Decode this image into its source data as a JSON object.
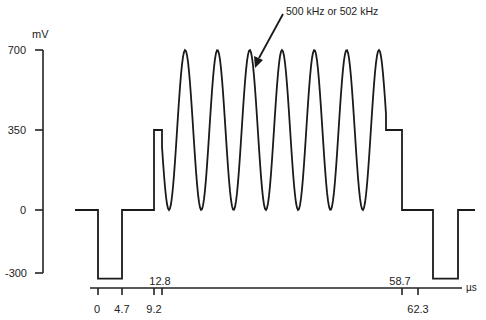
{
  "chart_data": {
    "type": "line",
    "title": "",
    "annotation": "500 kHz or 502 kHz",
    "ylabel": "mV",
    "xlabel": "µs",
    "ylim": [
      -300,
      700
    ],
    "y_ticks": [
      700,
      350,
      0,
      -300
    ],
    "x_ticks_below": [
      "0",
      "4.7",
      "9.2",
      "62.3"
    ],
    "x_ticks_above": [
      "12.8",
      "58.7"
    ],
    "grid": false,
    "legend": null,
    "series": [
      {
        "name": "waveform",
        "segments": [
          {
            "t_start": -3,
            "t_end": 0,
            "mV": 0,
            "shape": "flat"
          },
          {
            "t_start": 0,
            "t_end": 4.7,
            "mV": -300,
            "shape": "flat"
          },
          {
            "t_start": 4.7,
            "t_end": 9.2,
            "mV": 0,
            "shape": "flat"
          },
          {
            "t_start": 9.2,
            "t_end": 12.8,
            "mV": 350,
            "shape": "flat"
          },
          {
            "t_start": 12.8,
            "t_end": 58.7,
            "shape": "sine",
            "min_mV": 0,
            "max_mV": 700,
            "cycles": 7,
            "frequency": "500 kHz or 502 kHz"
          },
          {
            "t_start": 58.7,
            "t_end": 62.3,
            "mV": 350,
            "shape": "flat"
          },
          {
            "t_start": 62.3,
            "t_end": 65.3,
            "mV": 0,
            "shape": "flat"
          },
          {
            "t_start": 65.3,
            "t_end": 70.3,
            "mV": -300,
            "shape": "flat"
          },
          {
            "t_start": 70.3,
            "t_end": 73.5,
            "mV": 0,
            "shape": "flat"
          }
        ]
      }
    ]
  },
  "labels": {
    "y_unit": "mV",
    "x_unit": "µs",
    "y700": "700",
    "y350": "350",
    "y0": "0",
    "ym300": "-300",
    "x0": "0",
    "x47": "4.7",
    "x92": "9.2",
    "x128": "12.8",
    "x587": "58.7",
    "x623": "62.3",
    "annotation": "500 kHz or 502 kHz"
  }
}
